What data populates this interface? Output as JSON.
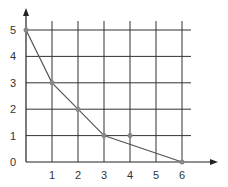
{
  "chart_data": {
    "type": "line",
    "title": "",
    "xlabel": "",
    "ylabel": "",
    "x_ticks": [
      "1",
      "2",
      "3",
      "4",
      "5",
      "6"
    ],
    "y_ticks": [
      "0",
      "1",
      "2",
      "3",
      "4",
      "5"
    ],
    "xlim": [
      0,
      6
    ],
    "ylim": [
      0,
      5
    ],
    "grid": true,
    "legend": null,
    "series": [
      {
        "name": "line",
        "x": [
          0,
          1,
          2,
          3,
          6
        ],
        "y": [
          5,
          3,
          2,
          1,
          0
        ]
      }
    ],
    "points": [
      {
        "x": 4,
        "y": 1,
        "note": "isolated point not on line"
      }
    ],
    "colors": {
      "grid": "#333333",
      "line": "#555555",
      "marker": "#888888",
      "axis": "#222222"
    }
  }
}
